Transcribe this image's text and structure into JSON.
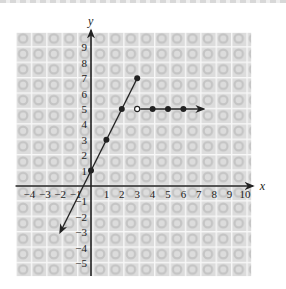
{
  "chart_data": {
    "type": "line",
    "title": "",
    "xlabel": "x",
    "ylabel": "y",
    "xlim": [
      -4,
      10
    ],
    "ylim": [
      -5,
      9
    ],
    "grid": true,
    "x_ticks": [
      "-4",
      "-3",
      "-2",
      "-1",
      "1",
      "2",
      "3",
      "4",
      "5",
      "6",
      "7",
      "8",
      "9",
      "10"
    ],
    "y_ticks": [
      "9",
      "8",
      "7",
      "6",
      "5",
      "4",
      "3",
      "2",
      "1",
      "-1",
      "-2",
      "-3",
      "-4",
      "-5"
    ],
    "series": [
      {
        "name": "line segment y = 2x + 1 (x ≤ 3)",
        "points": [
          [
            0,
            1
          ],
          [
            1,
            3
          ],
          [
            2,
            5
          ],
          [
            3,
            7
          ]
        ],
        "point_style": "closed",
        "arrow": {
          "direction": "down-left",
          "to": [
            -2,
            -3
          ]
        }
      },
      {
        "name": "horizontal ray y = 5 (x > 3)",
        "points": [
          [
            3,
            5
          ],
          [
            4,
            5
          ],
          [
            5,
            5
          ],
          [
            6,
            5
          ]
        ],
        "open_points": [
          [
            3,
            5
          ]
        ],
        "closed_points": [
          [
            4,
            5
          ],
          [
            5,
            5
          ],
          [
            6,
            5
          ]
        ],
        "arrow": {
          "direction": "right",
          "to": [
            7.3,
            5
          ]
        }
      }
    ]
  },
  "labels": {
    "x_axis": "x",
    "y_axis": "y"
  }
}
